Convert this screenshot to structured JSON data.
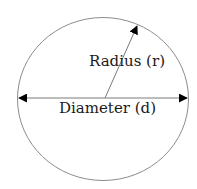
{
  "diagram": {
    "labels": {
      "radius": "Radius (r)",
      "diameter": "Diameter (d)"
    },
    "shapes": {
      "circle": {
        "cx": 103,
        "cy": 99,
        "rx": 85.5,
        "ry": 81.5,
        "stroke": "#8c8c8c"
      },
      "diameter_line": {
        "x1": 18,
        "y1": 98,
        "x2": 188,
        "y2": 98,
        "stroke": "#7a7a7a",
        "arrowheads": "both"
      },
      "radius_line": {
        "x1": 105,
        "y1": 98,
        "x2": 137,
        "y2": 25,
        "stroke": "#7a7a7a",
        "arrowhead": "end"
      }
    },
    "colors": {
      "background": "#ffffff",
      "arrowhead": "#000000",
      "text": "#1a1a1a"
    }
  }
}
